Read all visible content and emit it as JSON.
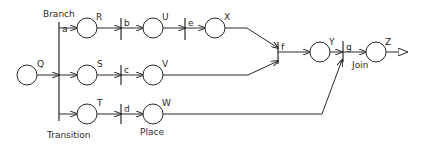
{
  "diagram": {
    "type": "petri-net",
    "annotations": {
      "branch": "Branch",
      "transition": "Transition",
      "place": "Place",
      "join": "Join"
    },
    "places": [
      {
        "id": "Q",
        "label": "Q"
      },
      {
        "id": "R",
        "label": "R"
      },
      {
        "id": "S",
        "label": "S"
      },
      {
        "id": "T",
        "label": "T"
      },
      {
        "id": "U",
        "label": "U"
      },
      {
        "id": "V",
        "label": "V"
      },
      {
        "id": "W",
        "label": "W"
      },
      {
        "id": "X",
        "label": "X"
      },
      {
        "id": "Y",
        "label": "Y"
      },
      {
        "id": "Z",
        "label": "Z"
      }
    ],
    "transitions": [
      {
        "id": "a",
        "label": "a"
      },
      {
        "id": "b",
        "label": "b"
      },
      {
        "id": "c",
        "label": "c"
      },
      {
        "id": "d",
        "label": "d"
      },
      {
        "id": "e",
        "label": "e"
      },
      {
        "id": "f",
        "label": "f"
      },
      {
        "id": "g",
        "label": "g"
      }
    ],
    "arcs": [
      [
        "Q",
        "a"
      ],
      [
        "a",
        "R"
      ],
      [
        "a",
        "S"
      ],
      [
        "a",
        "T"
      ],
      [
        "R",
        "b"
      ],
      [
        "b",
        "U"
      ],
      [
        "U",
        "e"
      ],
      [
        "e",
        "X"
      ],
      [
        "S",
        "c"
      ],
      [
        "c",
        "V"
      ],
      [
        "T",
        "d"
      ],
      [
        "d",
        "W"
      ],
      [
        "X",
        "f"
      ],
      [
        "V",
        "f"
      ],
      [
        "f",
        "Y"
      ],
      [
        "Y",
        "g"
      ],
      [
        "W",
        "g"
      ],
      [
        "g",
        "Z"
      ],
      [
        "Z",
        "output"
      ]
    ]
  }
}
